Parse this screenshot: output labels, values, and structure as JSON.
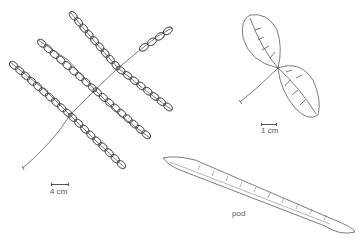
{
  "figure": {
    "background": "#ffffff",
    "line_color": "#444444",
    "panels": [
      {
        "id": "compound-leaf",
        "scale_label": "4 cm"
      },
      {
        "id": "leaflet-pair",
        "scale_label": "1 cm"
      },
      {
        "id": "pod",
        "caption": "pod"
      }
    ]
  }
}
